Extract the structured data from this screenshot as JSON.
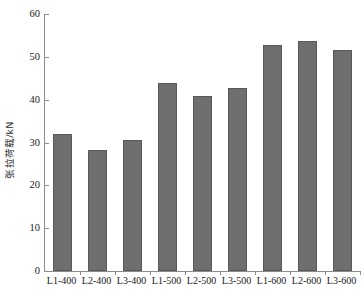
{
  "chart_data": {
    "type": "bar",
    "title": "",
    "xlabel": "",
    "ylabel": "张拉荷载/kN",
    "categories": [
      "L1-400",
      "L2-400",
      "L3-400",
      "L1-500",
      "L2-500",
      "L3-500",
      "L1-600",
      "L2-600",
      "L3-600"
    ],
    "values": [
      32.0,
      28.2,
      30.7,
      43.9,
      40.8,
      42.7,
      52.8,
      53.8,
      51.6
    ],
    "ylim": [
      0,
      60
    ],
    "yticks": [
      0,
      10,
      20,
      30,
      40,
      50,
      60
    ],
    "ytick_labels": [
      "0",
      "10",
      "20",
      "30",
      "40",
      "50",
      "60"
    ],
    "grid": false,
    "legend": false,
    "legend_position": "none",
    "series": [
      {
        "name": "张拉荷载",
        "values": [
          32.0,
          28.2,
          30.7,
          43.9,
          40.8,
          42.7,
          52.8,
          53.8,
          51.6
        ]
      }
    ],
    "colors": {
      "bar_fill": "#6e6e6e",
      "bar_edge": "#585858",
      "axis": "#8c8c8c",
      "text": "#1a1a1a",
      "background": "#ffffff"
    }
  }
}
